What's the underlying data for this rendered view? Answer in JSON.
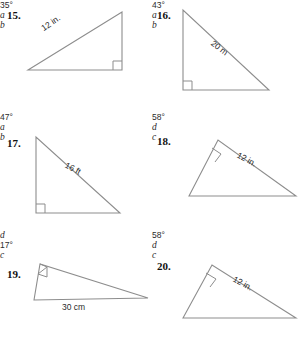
{
  "page": {
    "kind": "math-worksheet",
    "background_color": "#ffffff",
    "line_color": "#8d8d8d",
    "text_color": "#2b2b2b"
  },
  "problems": [
    {
      "number": "15.",
      "unit_label": "12 in.",
      "angle_label": "35°",
      "leg_label": "a",
      "base_label": "b",
      "right_angle": true
    },
    {
      "number": "16.",
      "unit_label": "20 m",
      "angle_label": "43°",
      "leg_label": "a",
      "base_label": "b",
      "right_angle": true
    },
    {
      "number": "17.",
      "unit_label": "16 ft",
      "angle_label": "47°",
      "leg_label": "a",
      "base_label": "b",
      "right_angle": true
    },
    {
      "number": "18.",
      "unit_label": "12 in.",
      "angle_label": "58°",
      "leg_label": "d",
      "base_label": "c",
      "right_angle": true
    },
    {
      "number": "19.",
      "unit_label": "30 cm",
      "angle_label": "17°",
      "leg_label": "c",
      "base_label": "d",
      "right_angle": true
    },
    {
      "number": "20.",
      "unit_label": "12 in.",
      "angle_label": "58°",
      "leg_label": "d",
      "base_label": "c",
      "right_angle": true
    }
  ]
}
